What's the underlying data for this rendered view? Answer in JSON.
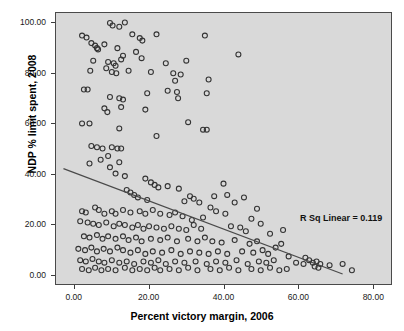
{
  "chart_data": {
    "type": "scatter",
    "title": "",
    "xlabel": "Percent victory margin, 2006",
    "ylabel": "NDP % limit spent, 2008",
    "xlim": [
      -5,
      85
    ],
    "ylim": [
      -4,
      104
    ],
    "xticks": [
      "0.00",
      "20.00",
      "40.00",
      "60.00",
      "80.00"
    ],
    "xtick_values": [
      0,
      20,
      40,
      60,
      80
    ],
    "yticks": [
      "0.00",
      "20.00",
      "40.00",
      "60.00",
      "80.00",
      "100.00"
    ],
    "ytick_values": [
      0,
      20,
      40,
      60,
      80,
      100
    ],
    "grid": false,
    "legend": "none",
    "annotation": "R Sq Linear = 0.119",
    "r_squared": 0.119,
    "fit_line": {
      "type": "linear",
      "x_start": -3.0,
      "y_start": 42.0,
      "x_end": 72.0,
      "y_end": 0.0,
      "slope": -0.56,
      "intercept": 40.3
    },
    "marker": {
      "shape": "circle-open",
      "size": 5,
      "stroke": "#333333",
      "fill": "none"
    },
    "plot_background": "#d9d9d9",
    "points": [
      [
        2.0,
        95.0
      ],
      [
        3.2,
        94.2
      ],
      [
        4.5,
        92.0
      ],
      [
        5.5,
        91.0
      ],
      [
        6.0,
        90.0
      ],
      [
        6.3,
        89.5
      ],
      [
        9.5,
        100.0
      ],
      [
        10.2,
        99.0
      ],
      [
        12.0,
        98.5
      ],
      [
        13.5,
        100.2
      ],
      [
        15.5,
        95.5
      ],
      [
        17.5,
        94.0
      ],
      [
        18.2,
        93.0
      ],
      [
        22.0,
        95.5
      ],
      [
        35.0,
        95.0
      ],
      [
        44.0,
        87.5
      ],
      [
        8.0,
        91.5
      ],
      [
        11.5,
        90.0
      ],
      [
        13.0,
        87.0
      ],
      [
        16.5,
        88.5
      ],
      [
        5.0,
        85.0
      ],
      [
        9.0,
        84.5
      ],
      [
        10.5,
        84.0
      ],
      [
        11.0,
        83.0
      ],
      [
        12.5,
        85.5
      ],
      [
        18.0,
        86.0
      ],
      [
        24.5,
        84.0
      ],
      [
        30.0,
        85.0
      ],
      [
        4.2,
        81.0
      ],
      [
        8.5,
        82.0
      ],
      [
        10.0,
        80.5
      ],
      [
        11.2,
        80.0
      ],
      [
        14.5,
        81.0
      ],
      [
        20.5,
        80.5
      ],
      [
        26.5,
        80.0
      ],
      [
        28.5,
        79.5
      ],
      [
        2.5,
        73.5
      ],
      [
        3.5,
        73.5
      ],
      [
        27.0,
        77.0
      ],
      [
        36.0,
        77.5
      ],
      [
        25.0,
        73.0
      ],
      [
        27.5,
        72.5
      ],
      [
        19.5,
        72.0
      ],
      [
        35.5,
        72.0
      ],
      [
        9.5,
        70.5
      ],
      [
        12.0,
        70.0
      ],
      [
        13.0,
        69.5
      ],
      [
        27.8,
        70.0
      ],
      [
        8.0,
        66.0
      ],
      [
        8.8,
        64.5
      ],
      [
        12.5,
        66.5
      ],
      [
        19.0,
        65.5
      ],
      [
        2.0,
        60.0
      ],
      [
        4.0,
        60.0
      ],
      [
        30.5,
        60.5
      ],
      [
        12.0,
        58.0
      ],
      [
        34.5,
        57.5
      ],
      [
        35.5,
        57.5
      ],
      [
        22.0,
        55.0
      ],
      [
        4.5,
        51.0
      ],
      [
        6.0,
        50.5
      ],
      [
        7.5,
        50.0
      ],
      [
        10.0,
        50.5
      ],
      [
        11.5,
        50.0
      ],
      [
        12.5,
        50.0
      ],
      [
        9.0,
        47.0
      ],
      [
        7.0,
        45.5
      ],
      [
        4.0,
        44.0
      ],
      [
        12.0,
        44.5
      ],
      [
        9.5,
        42.5
      ],
      [
        11.0,
        40.0
      ],
      [
        13.5,
        39.0
      ],
      [
        19.0,
        38.0
      ],
      [
        20.5,
        36.5
      ],
      [
        21.5,
        35.5
      ],
      [
        22.5,
        34.5
      ],
      [
        25.0,
        35.0
      ],
      [
        28.0,
        34.0
      ],
      [
        40.0,
        36.0
      ],
      [
        14.0,
        33.5
      ],
      [
        15.0,
        32.5
      ],
      [
        16.0,
        31.5
      ],
      [
        17.0,
        30.5
      ],
      [
        19.5,
        29.5
      ],
      [
        29.5,
        29.0
      ],
      [
        31.0,
        31.0
      ],
      [
        32.0,
        30.0
      ],
      [
        33.5,
        28.5
      ],
      [
        2.0,
        25.0
      ],
      [
        3.0,
        24.5
      ],
      [
        5.5,
        26.5
      ],
      [
        6.5,
        25.5
      ],
      [
        8.0,
        24.0
      ],
      [
        10.0,
        25.0
      ],
      [
        11.0,
        24.0
      ],
      [
        13.0,
        25.5
      ],
      [
        15.0,
        24.5
      ],
      [
        17.5,
        25.0
      ],
      [
        19.0,
        24.0
      ],
      [
        21.0,
        25.5
      ],
      [
        23.0,
        24.0
      ],
      [
        25.5,
        23.5
      ],
      [
        27.0,
        24.5
      ],
      [
        29.0,
        23.0
      ],
      [
        36.5,
        26.5
      ],
      [
        38.0,
        25.0
      ],
      [
        40.5,
        24.0
      ],
      [
        1.5,
        21.0
      ],
      [
        3.5,
        20.5
      ],
      [
        5.0,
        20.0
      ],
      [
        6.5,
        19.5
      ],
      [
        8.5,
        20.5
      ],
      [
        10.5,
        19.0
      ],
      [
        12.0,
        20.0
      ],
      [
        13.5,
        19.5
      ],
      [
        15.5,
        18.5
      ],
      [
        17.0,
        19.5
      ],
      [
        18.5,
        18.0
      ],
      [
        20.0,
        19.0
      ],
      [
        22.0,
        18.5
      ],
      [
        24.0,
        18.0
      ],
      [
        26.0,
        19.0
      ],
      [
        28.0,
        18.0
      ],
      [
        30.0,
        17.5
      ],
      [
        32.0,
        19.5
      ],
      [
        34.0,
        18.0
      ],
      [
        42.0,
        19.0
      ],
      [
        44.5,
        18.5
      ],
      [
        46.0,
        17.0
      ],
      [
        2.5,
        15.0
      ],
      [
        4.0,
        14.5
      ],
      [
        6.0,
        15.5
      ],
      [
        7.5,
        14.0
      ],
      [
        9.0,
        15.0
      ],
      [
        11.0,
        14.0
      ],
      [
        13.0,
        15.0
      ],
      [
        14.5,
        13.5
      ],
      [
        16.5,
        14.5
      ],
      [
        18.0,
        13.0
      ],
      [
        20.5,
        14.0
      ],
      [
        23.0,
        13.5
      ],
      [
        25.0,
        14.5
      ],
      [
        27.5,
        13.0
      ],
      [
        30.5,
        14.0
      ],
      [
        33.0,
        13.0
      ],
      [
        35.0,
        14.5
      ],
      [
        37.0,
        13.0
      ],
      [
        39.5,
        12.5
      ],
      [
        43.0,
        13.5
      ],
      [
        47.0,
        12.0
      ],
      [
        49.0,
        13.0
      ],
      [
        1.0,
        10.0
      ],
      [
        2.8,
        9.5
      ],
      [
        4.5,
        10.5
      ],
      [
        6.0,
        9.0
      ],
      [
        7.8,
        10.0
      ],
      [
        9.5,
        9.0
      ],
      [
        11.5,
        10.5
      ],
      [
        13.0,
        9.5
      ],
      [
        15.0,
        8.5
      ],
      [
        17.0,
        9.5
      ],
      [
        19.0,
        8.0
      ],
      [
        21.0,
        9.0
      ],
      [
        23.5,
        8.5
      ],
      [
        26.0,
        9.5
      ],
      [
        28.5,
        8.0
      ],
      [
        31.0,
        9.0
      ],
      [
        33.5,
        8.5
      ],
      [
        36.0,
        8.0
      ],
      [
        38.5,
        9.0
      ],
      [
        41.0,
        8.0
      ],
      [
        45.0,
        9.0
      ],
      [
        48.0,
        8.5
      ],
      [
        50.5,
        9.5
      ],
      [
        52.0,
        8.0
      ],
      [
        1.5,
        5.5
      ],
      [
        3.0,
        5.0
      ],
      [
        4.8,
        6.0
      ],
      [
        6.5,
        5.0
      ],
      [
        8.0,
        4.5
      ],
      [
        10.0,
        5.5
      ],
      [
        12.0,
        4.5
      ],
      [
        14.0,
        5.0
      ],
      [
        16.0,
        4.0
      ],
      [
        18.5,
        5.0
      ],
      [
        20.5,
        4.5
      ],
      [
        22.5,
        5.5
      ],
      [
        24.5,
        4.0
      ],
      [
        27.0,
        5.0
      ],
      [
        29.5,
        4.5
      ],
      [
        32.5,
        5.0
      ],
      [
        35.5,
        4.0
      ],
      [
        38.0,
        5.0
      ],
      [
        40.5,
        4.5
      ],
      [
        43.5,
        5.5
      ],
      [
        46.5,
        4.0
      ],
      [
        49.5,
        5.0
      ],
      [
        51.5,
        4.5
      ],
      [
        53.5,
        5.5
      ],
      [
        2.0,
        2.0
      ],
      [
        3.8,
        1.5
      ],
      [
        5.5,
        2.5
      ],
      [
        7.2,
        1.5
      ],
      [
        9.0,
        2.0
      ],
      [
        11.0,
        1.5
      ],
      [
        13.5,
        2.5
      ],
      [
        15.5,
        1.5
      ],
      [
        17.5,
        2.0
      ],
      [
        19.5,
        1.5
      ],
      [
        21.5,
        2.5
      ],
      [
        23.0,
        1.5
      ],
      [
        25.5,
        2.0
      ],
      [
        28.0,
        1.5
      ],
      [
        30.5,
        2.5
      ],
      [
        33.0,
        1.5
      ],
      [
        36.5,
        2.0
      ],
      [
        39.0,
        1.5
      ],
      [
        41.5,
        2.5
      ],
      [
        44.0,
        1.5
      ],
      [
        47.5,
        2.0
      ],
      [
        50.0,
        1.5
      ],
      [
        52.5,
        2.5
      ],
      [
        55.0,
        1.5
      ],
      [
        57.0,
        2.0
      ],
      [
        59.5,
        4.5
      ],
      [
        61.5,
        4.0
      ],
      [
        63.0,
        5.5
      ],
      [
        64.0,
        4.5
      ],
      [
        64.5,
        3.0
      ],
      [
        65.0,
        5.0
      ],
      [
        65.5,
        2.5
      ],
      [
        66.0,
        4.0
      ],
      [
        68.5,
        3.5
      ],
      [
        72.0,
        4.0
      ],
      [
        74.5,
        1.5
      ],
      [
        57.5,
        7.0
      ],
      [
        62.0,
        6.5
      ],
      [
        54.0,
        10.5
      ],
      [
        55.5,
        12.0
      ],
      [
        52.5,
        16.0
      ],
      [
        56.0,
        17.5
      ],
      [
        50.0,
        20.0
      ],
      [
        47.5,
        22.0
      ],
      [
        43.0,
        28.5
      ],
      [
        45.5,
        30.5
      ],
      [
        41.0,
        31.5
      ],
      [
        49.0,
        26.0
      ],
      [
        37.5,
        31.0
      ],
      [
        31.5,
        21.5
      ],
      [
        34.5,
        22.5
      ]
    ]
  }
}
